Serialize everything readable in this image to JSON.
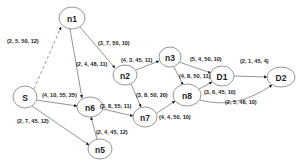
{
  "diagram": {
    "type": "directed-graph",
    "nodes": [
      {
        "id": "n1",
        "label": "n1",
        "cx": 72,
        "cy": 18,
        "rx": 13,
        "ry": 11
      },
      {
        "id": "n2",
        "label": "n2",
        "cx": 125,
        "cy": 75,
        "rx": 12,
        "ry": 10
      },
      {
        "id": "n3",
        "label": "n3",
        "cx": 170,
        "cy": 57,
        "rx": 11,
        "ry": 10
      },
      {
        "id": "n6",
        "label": "n6",
        "cx": 90,
        "cy": 107,
        "rx": 13,
        "ry": 10
      },
      {
        "id": "n7",
        "label": "n7",
        "cx": 145,
        "cy": 117,
        "rx": 12,
        "ry": 10
      },
      {
        "id": "n5",
        "label": "n5",
        "cx": 100,
        "cy": 149,
        "rx": 12,
        "ry": 10
      },
      {
        "id": "n8",
        "label": "n8",
        "cx": 187,
        "cy": 95,
        "rx": 14,
        "ry": 11
      },
      {
        "id": "D1",
        "label": "D1",
        "cx": 222,
        "cy": 76,
        "rx": 12,
        "ry": 10
      },
      {
        "id": "D2",
        "label": "D2",
        "cx": 281,
        "cy": 77,
        "rx": 14,
        "ry": 10
      },
      {
        "id": "S",
        "label": "S",
        "cx": 25,
        "cy": 97,
        "rx": 12,
        "ry": 11
      }
    ],
    "edges": [
      {
        "from": "S",
        "to": "n1",
        "label": "(2, 5, 50, 12)",
        "style": "dashed",
        "x1": 34,
        "y1": 89,
        "x2": 61,
        "y2": 27,
        "lx": 7,
        "ly": 43
      },
      {
        "from": "n1",
        "to": "n2",
        "label": "(3, 7, 50, 10)",
        "style": "solid",
        "x1": 80,
        "y1": 27,
        "x2": 115,
        "y2": 68,
        "lx": 98,
        "ly": 45
      },
      {
        "from": "n1",
        "to": "n6",
        "label": "(2, 4, 48, 11)",
        "style": "solid",
        "x1": 70,
        "y1": 29,
        "x2": 82,
        "y2": 98,
        "lx": 76,
        "ly": 66
      },
      {
        "from": "n2",
        "to": "n3",
        "label": "(4, 3, 45, 11)",
        "style": "solid",
        "x1": 136,
        "y1": 70,
        "x2": 159,
        "y2": 61,
        "lx": 121,
        "ly": 62
      },
      {
        "from": "n3",
        "to": "D1",
        "label": "(5, 4, 50, 10)",
        "style": "solid",
        "x1": 179,
        "y1": 62,
        "x2": 211,
        "y2": 73,
        "lx": 190,
        "ly": 61
      },
      {
        "from": "n3",
        "to": "n8",
        "label": "(4, 8, 50, 11)",
        "style": "solid",
        "x1": 174,
        "y1": 67,
        "x2": 183,
        "y2": 85,
        "lx": 179,
        "ly": 78
      },
      {
        "from": "n2",
        "to": "n7",
        "label": "(3, 8, 50, 20)",
        "style": "solid",
        "x1": 131,
        "y1": 84,
        "x2": 141,
        "y2": 107,
        "lx": 136,
        "ly": 97
      },
      {
        "from": "S",
        "to": "n6",
        "label": "(4, 10, 55, 25)",
        "style": "solid",
        "x1": 36,
        "y1": 100,
        "x2": 77,
        "y2": 106,
        "lx": 42,
        "ly": 97
      },
      {
        "from": "n6",
        "to": "n7",
        "label": "(3, 8, 55, 11)",
        "style": "solid",
        "x1": 103,
        "y1": 109,
        "x2": 133,
        "y2": 116,
        "lx": 100,
        "ly": 108
      },
      {
        "from": "S",
        "to": "n5",
        "label": "(2, 7, 45, 12)",
        "style": "solid",
        "x1": 32,
        "y1": 106,
        "x2": 89,
        "y2": 145,
        "lx": 17,
        "ly": 123
      },
      {
        "from": "n5",
        "to": "n6",
        "label": "(2, 4, 45, 12)",
        "style": "solid",
        "x1": 97,
        "y1": 139,
        "x2": 91,
        "y2": 117,
        "lx": 96,
        "ly": 134
      },
      {
        "from": "n7",
        "to": "n8",
        "label": "(4, 4, 50, 10)",
        "style": "solid",
        "x1": 157,
        "y1": 113,
        "x2": 175,
        "y2": 101,
        "lx": 159,
        "ly": 119
      },
      {
        "from": "n8",
        "to": "D1",
        "label": "(3, 6, 45, 10)",
        "style": "solid",
        "x1": 199,
        "y1": 89,
        "x2": 212,
        "y2": 82,
        "lx": 204,
        "ly": 94
      },
      {
        "from": "n8",
        "to": "D2",
        "label": "(2, 5, 48, 10)",
        "style": "solid",
        "curved": true,
        "x1": 200,
        "y1": 100,
        "x2": 272,
        "y2": 85,
        "lx": 225,
        "ly": 104
      },
      {
        "from": "D1",
        "to": "D2",
        "label": "(2, 1, 45, 4)",
        "style": "solid",
        "x1": 234,
        "y1": 76,
        "x2": 267,
        "y2": 77,
        "lx": 240,
        "ly": 63
      }
    ]
  }
}
